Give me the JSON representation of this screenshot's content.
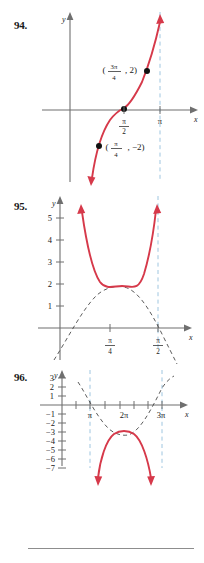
{
  "page": {
    "divider_present": true,
    "colors": {
      "curve_red": "#d6394a",
      "guide_dashed": "#4a4a4a",
      "asymptote_blue": "#9fc6e0",
      "axis_gray": "#6f6f6f",
      "text_black": "#1a1a1a"
    }
  },
  "problems": [
    {
      "number": "94.",
      "axis": {
        "x_label": "x",
        "y_label": "y"
      },
      "x_ticks": [
        {
          "label_num": "π",
          "label_den": "2",
          "is_fraction": true
        },
        {
          "label_num": "π",
          "label_den": "",
          "is_fraction": false
        }
      ],
      "points": [
        {
          "label_open": "(",
          "num": "3π",
          "den": "4",
          "rest": ", 2)"
        },
        {
          "label_open": "(",
          "num": "π",
          "den": "4",
          "rest": ", −2)"
        }
      ],
      "point_label_1": "(3π/4, 2)",
      "point_label_2": "(π/4, −2)",
      "asymptote_labels": [
        "π"
      ],
      "curve_type": "increasing tangent-like curve through (π/2, 0)"
    },
    {
      "number": "95.",
      "axis": {
        "x_label": "x",
        "y_label": "y"
      },
      "y_ticks": [
        "1",
        "2",
        "3",
        "4",
        "5"
      ],
      "x_ticks": [
        {
          "label_num": "π",
          "label_den": "4"
        },
        {
          "label_num": "π",
          "label_den": "2"
        }
      ],
      "curve_type": "upward U-shaped secant-like curve with minimum at y = 2",
      "guide_type": "dashed sine-like arch peaking near y = 2"
    },
    {
      "number": "96.",
      "axis": {
        "x_label": "x",
        "y_label": "y"
      },
      "y_ticks_positive": [
        "1",
        "2",
        "3"
      ],
      "y_ticks_negative": [
        "−1",
        "−2",
        "−3",
        "−4",
        "−5",
        "−6",
        "−7"
      ],
      "x_ticks": [
        "π",
        "2π",
        "3π"
      ],
      "curve_type": "downward arch with maximum at y = −3, arrows pointing down",
      "guide_type": "dashed upward parabola-like guide with minimum near y = −3"
    }
  ]
}
